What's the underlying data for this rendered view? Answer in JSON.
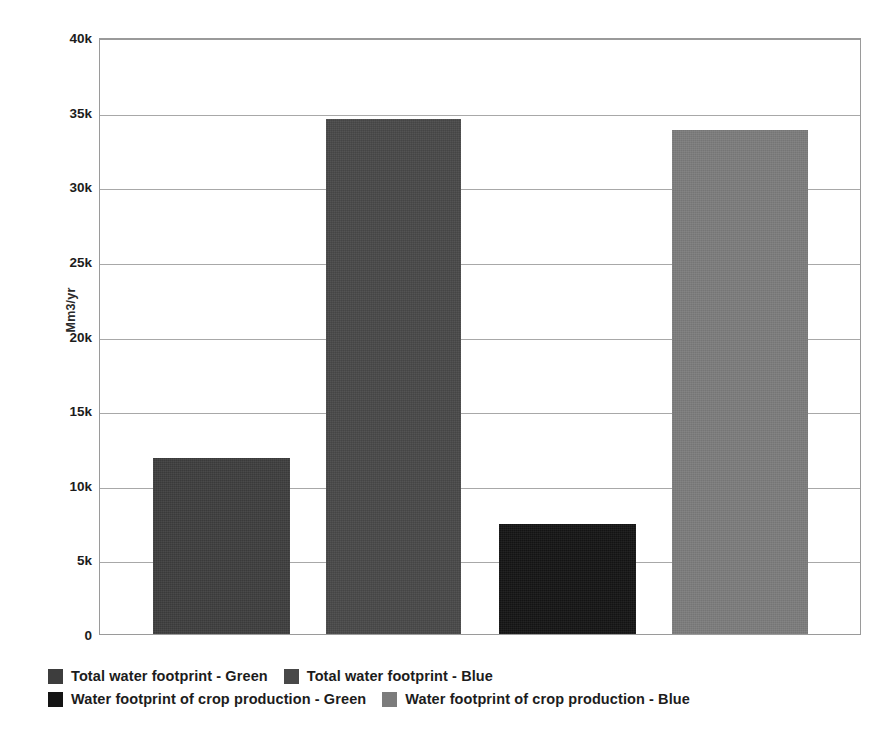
{
  "chart_data": {
    "type": "bar",
    "title": "",
    "xlabel": "",
    "ylabel": "Mm3/yr",
    "ylim": [
      0,
      40000
    ],
    "grid": true,
    "legend_position": "bottom",
    "y_ticks": [
      {
        "value": 0,
        "label": "0"
      },
      {
        "value": 5000,
        "label": "5k"
      },
      {
        "value": 10000,
        "label": "10k"
      },
      {
        "value": 15000,
        "label": "15k"
      },
      {
        "value": 20000,
        "label": "20k"
      },
      {
        "value": 25000,
        "label": "25k"
      },
      {
        "value": 30000,
        "label": "30k"
      },
      {
        "value": 35000,
        "label": "35k"
      },
      {
        "value": 40000,
        "label": "40k"
      }
    ],
    "categories": [
      "Total water footprint - Green",
      "Total water footprint - Blue",
      "Water footprint of crop production - Green",
      "Water footprint of crop production - Blue"
    ],
    "values": [
      11800,
      34500,
      7400,
      33800
    ],
    "colors": [
      "#3d3d3d",
      "#484848",
      "#141414",
      "#7c7c7c"
    ],
    "bars": [
      {
        "label": "Total water footprint - Green",
        "value": 11800,
        "color": "#3d3d3d"
      },
      {
        "label": "Total water footprint - Blue",
        "value": 34500,
        "color": "#484848"
      },
      {
        "label": "Water footprint of crop production - Green",
        "value": 7400,
        "color": "#141414"
      },
      {
        "label": "Water footprint of crop production - Blue",
        "value": 33800,
        "color": "#7c7c7c"
      }
    ]
  },
  "legend": {
    "rows": [
      [
        {
          "label": "Total water footprint - Green",
          "color": "#3d3d3d"
        },
        {
          "label": "Total water footprint - Blue",
          "color": "#484848"
        }
      ],
      [
        {
          "label": "Water footprint of crop production - Green",
          "color": "#141414"
        },
        {
          "label": "Water footprint of crop production - Blue",
          "color": "#7c7c7c"
        }
      ]
    ]
  },
  "axis": {
    "y_title": "Mm3/yr"
  }
}
